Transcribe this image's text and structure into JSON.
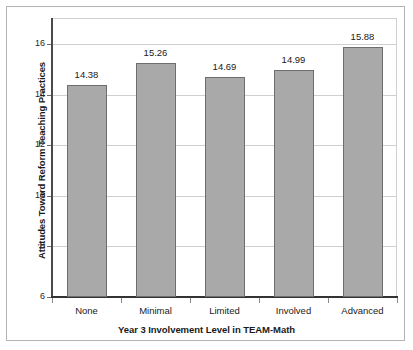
{
  "chart_data": {
    "type": "bar",
    "title": "",
    "xlabel": "Year 3 Involvement Level in TEAM-Math",
    "ylabel": "Attitudes Toward Reform Teaching Practices",
    "categories": [
      "None",
      "Minimal",
      "Limited",
      "Involved",
      "Advanced"
    ],
    "values": [
      14.38,
      15.26,
      14.69,
      14.99,
      15.88
    ],
    "data_labels": [
      "14.38",
      "15.26",
      "14.69",
      "14.99",
      "15.88"
    ],
    "ylim": [
      6,
      16
    ],
    "yticks": [
      6,
      8,
      10,
      12,
      14,
      16
    ],
    "ytick_labels": [
      "6",
      "8",
      "10",
      "12",
      "14",
      "16"
    ],
    "grid": true,
    "grid_axis": "y",
    "legend": false,
    "legend_position": "none",
    "series": [
      {
        "name": "Attitudes Toward Reform Teaching Practices",
        "values": [
          14.38,
          15.26,
          14.69,
          14.99,
          15.88
        ]
      }
    ],
    "colors": {
      "bar_fill": "#a9a9a9",
      "bar_edge": "#6e6e6e",
      "gridline": "#cfcfcf",
      "axis": "#333333",
      "text": "#1a1a1a",
      "frame": "#b4b4b4",
      "background": "#ffffff"
    }
  }
}
